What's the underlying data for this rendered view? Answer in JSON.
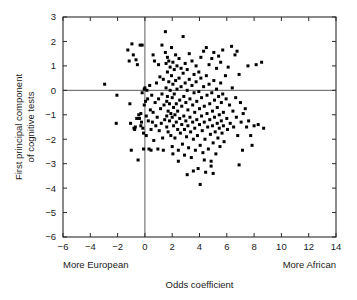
{
  "chart_data": {
    "type": "scatter",
    "title": "",
    "xlabel": "Odds coefficient",
    "ylabel": "First principal component\nof cognitive tests",
    "ylabel_line1": "First principal component",
    "ylabel_line2": "of cognitive tests",
    "xlim": [
      -6,
      14
    ],
    "ylim": [
      -6,
      3
    ],
    "xticks": [
      -6,
      -4,
      -2,
      0,
      2,
      4,
      6,
      8,
      10,
      12,
      14
    ],
    "yticks": [
      3,
      2,
      1,
      0,
      -1,
      -2,
      -3,
      -4,
      -5,
      -6
    ],
    "xticklabels": [
      "−6",
      "−4",
      "−2",
      "0",
      "2",
      "4",
      "6",
      "8",
      "10",
      "12",
      "14"
    ],
    "yticklabels": [
      "3",
      "2",
      "1",
      "0",
      "−1",
      "−2",
      "−3",
      "−4",
      "−5",
      "−6"
    ],
    "grid": false,
    "legend": false,
    "marker": "square",
    "marker_color": "#000000",
    "marker_size": 3,
    "reference_lines": [
      {
        "axis": "x",
        "value": 0
      },
      {
        "axis": "y",
        "value": 0
      }
    ],
    "annotations": [
      {
        "text": "More European",
        "position": "below-axis-left",
        "x": -6,
        "y": -6
      },
      {
        "text": "More African",
        "position": "below-axis-right",
        "x": 14,
        "y": -6
      }
    ],
    "n_points": 252,
    "points": [
      [
        -2.95,
        0.25
      ],
      [
        -2.05,
        -0.2
      ],
      [
        -2.1,
        -1.35
      ],
      [
        -1.25,
        1.65
      ],
      [
        -1.15,
        1.2
      ],
      [
        -1.1,
        -0.55
      ],
      [
        -1.05,
        -1.35
      ],
      [
        -1.0,
        -2.45
      ],
      [
        -0.95,
        1.9
      ],
      [
        -0.85,
        1.45
      ],
      [
        -0.8,
        -1.55
      ],
      [
        -0.75,
        -1.6
      ],
      [
        -0.7,
        -1.5
      ],
      [
        -0.65,
        1.25
      ],
      [
        -0.6,
        -1.15
      ],
      [
        -0.55,
        1.05
      ],
      [
        -0.5,
        -2.85
      ],
      [
        -0.45,
        -1.0
      ],
      [
        -0.4,
        -1.15
      ],
      [
        -0.35,
        1.85
      ],
      [
        -0.3,
        -0.95
      ],
      [
        -0.3,
        -1.45
      ],
      [
        -0.25,
        -1.3
      ],
      [
        -0.2,
        1.85
      ],
      [
        -0.2,
        -0.1
      ],
      [
        -0.15,
        -1.55
      ],
      [
        -0.1,
        -1.75
      ],
      [
        -0.1,
        -2.4
      ],
      [
        -0.05,
        0.05
      ],
      [
        -0.05,
        -0.6
      ],
      [
        0.0,
        0.1
      ],
      [
        0.05,
        -0.45
      ],
      [
        0.1,
        -1.05
      ],
      [
        0.1,
        -1.85
      ],
      [
        0.15,
        0.0
      ],
      [
        0.2,
        -0.35
      ],
      [
        0.25,
        -1.25
      ],
      [
        0.3,
        -2.4
      ],
      [
        0.35,
        0.2
      ],
      [
        0.4,
        -0.8
      ],
      [
        0.45,
        -1.6
      ],
      [
        0.5,
        -0.2
      ],
      [
        0.55,
        -1.3
      ],
      [
        0.6,
        1.45
      ],
      [
        0.6,
        -0.9
      ],
      [
        0.65,
        -2.05
      ],
      [
        0.7,
        1.2
      ],
      [
        0.75,
        -0.5
      ],
      [
        0.8,
        -1.45
      ],
      [
        0.85,
        0.3
      ],
      [
        0.9,
        -1.1
      ],
      [
        0.95,
        -2.4
      ],
      [
        1.0,
        1.05
      ],
      [
        1.0,
        -0.35
      ],
      [
        1.05,
        -1.65
      ],
      [
        1.1,
        0.55
      ],
      [
        1.15,
        -0.75
      ],
      [
        1.2,
        -1.35
      ],
      [
        1.25,
        1.85
      ],
      [
        1.25,
        -0.15
      ],
      [
        1.3,
        -1.95
      ],
      [
        1.35,
        0.45
      ],
      [
        1.4,
        -0.6
      ],
      [
        1.45,
        -1.2
      ],
      [
        1.5,
        2.4
      ],
      [
        1.5,
        1.55
      ],
      [
        1.55,
        1.1
      ],
      [
        1.55,
        0.1
      ],
      [
        1.6,
        -0.45
      ],
      [
        1.6,
        -1.05
      ],
      [
        1.6,
        -1.5
      ],
      [
        1.65,
        1.35
      ],
      [
        1.65,
        0.75
      ],
      [
        1.65,
        -0.25
      ],
      [
        1.7,
        -0.85
      ],
      [
        1.7,
        -1.7
      ],
      [
        1.75,
        1.2
      ],
      [
        1.75,
        0.35
      ],
      [
        1.8,
        -0.55
      ],
      [
        1.8,
        -1.25
      ],
      [
        1.85,
        0.95
      ],
      [
        1.85,
        0.0
      ],
      [
        1.9,
        -0.95
      ],
      [
        1.9,
        -1.85
      ],
      [
        1.95,
        1.75
      ],
      [
        1.95,
        0.6
      ],
      [
        2.0,
        -0.3
      ],
      [
        2.0,
        -1.1
      ],
      [
        2.0,
        -2.3
      ],
      [
        2.05,
        1.15
      ],
      [
        2.05,
        0.25
      ],
      [
        2.1,
        -0.7
      ],
      [
        2.1,
        -1.45
      ],
      [
        2.15,
        0.85
      ],
      [
        2.15,
        -0.15
      ],
      [
        2.2,
        -1.0
      ],
      [
        2.2,
        -1.95
      ],
      [
        2.25,
        1.45
      ],
      [
        2.25,
        0.4
      ],
      [
        2.3,
        -0.55
      ],
      [
        2.3,
        -1.3
      ],
      [
        2.35,
        1.0
      ],
      [
        2.35,
        0.05
      ],
      [
        2.4,
        -0.85
      ],
      [
        2.4,
        -1.6
      ],
      [
        2.45,
        -2.45
      ],
      [
        2.5,
        1.3
      ],
      [
        2.5,
        0.5
      ],
      [
        2.55,
        -0.4
      ],
      [
        2.55,
        -1.15
      ],
      [
        2.6,
        -1.75
      ],
      [
        2.65,
        0.9
      ],
      [
        2.65,
        0.15
      ],
      [
        2.7,
        -0.65
      ],
      [
        2.7,
        -1.4
      ],
      [
        2.75,
        -2.2
      ],
      [
        2.8,
        2.2
      ],
      [
        2.8,
        0.7
      ],
      [
        2.85,
        -0.25
      ],
      [
        2.85,
        -1.05
      ],
      [
        2.9,
        -1.6
      ],
      [
        2.9,
        -2.65
      ],
      [
        2.95,
        1.1
      ],
      [
        2.95,
        0.3
      ],
      [
        3.0,
        -0.5
      ],
      [
        3.0,
        -1.25
      ],
      [
        3.05,
        -1.9
      ],
      [
        3.1,
        0.85
      ],
      [
        3.1,
        0.0
      ],
      [
        3.15,
        -0.8
      ],
      [
        3.15,
        -1.45
      ],
      [
        3.2,
        -2.35
      ],
      [
        3.25,
        1.5
      ],
      [
        3.25,
        0.45
      ],
      [
        3.3,
        -0.35
      ],
      [
        3.3,
        -1.1
      ],
      [
        3.35,
        -1.7
      ],
      [
        3.4,
        -2.75
      ],
      [
        3.45,
        1.2
      ],
      [
        3.45,
        0.2
      ],
      [
        3.5,
        -0.6
      ],
      [
        3.5,
        -1.3
      ],
      [
        3.55,
        -2.0
      ],
      [
        3.6,
        0.65
      ],
      [
        3.6,
        -0.1
      ],
      [
        3.65,
        -0.9
      ],
      [
        3.65,
        -1.55
      ],
      [
        3.7,
        -2.45
      ],
      [
        3.75,
        1.0
      ],
      [
        3.75,
        0.35
      ],
      [
        3.8,
        -0.45
      ],
      [
        3.8,
        -1.2
      ],
      [
        3.85,
        -1.85
      ],
      [
        3.9,
        -3.2
      ],
      [
        3.95,
        0.75
      ],
      [
        3.95,
        -0.05
      ],
      [
        4.0,
        -0.75
      ],
      [
        4.0,
        -1.4
      ],
      [
        4.05,
        -2.25
      ],
      [
        4.05,
        -3.85
      ],
      [
        4.1,
        1.35
      ],
      [
        4.1,
        0.5
      ],
      [
        4.15,
        -0.3
      ],
      [
        4.15,
        -1.05
      ],
      [
        4.2,
        -1.65
      ],
      [
        4.25,
        -2.55
      ],
      [
        4.3,
        1.6
      ],
      [
        4.3,
        0.15
      ],
      [
        4.35,
        -0.65
      ],
      [
        4.35,
        -1.3
      ],
      [
        4.4,
        -2.0
      ],
      [
        4.45,
        -3.35
      ],
      [
        4.5,
        1.75
      ],
      [
        4.5,
        0.6
      ],
      [
        4.55,
        -0.2
      ],
      [
        4.55,
        -0.95
      ],
      [
        4.6,
        -1.5
      ],
      [
        4.65,
        -2.4
      ],
      [
        4.7,
        1.05
      ],
      [
        4.7,
        0.25
      ],
      [
        4.75,
        -0.55
      ],
      [
        4.75,
        -1.2
      ],
      [
        4.8,
        -1.8
      ],
      [
        4.85,
        -2.9
      ],
      [
        4.9,
        1.3
      ],
      [
        4.9,
        -0.1
      ],
      [
        4.95,
        -0.85
      ],
      [
        4.95,
        -1.45
      ],
      [
        5.0,
        -2.15
      ],
      [
        5.05,
        1.55
      ],
      [
        5.05,
        0.4
      ],
      [
        5.1,
        -0.4
      ],
      [
        5.1,
        -1.1
      ],
      [
        5.15,
        -1.7
      ],
      [
        5.2,
        -2.6
      ],
      [
        5.25,
        0.9
      ],
      [
        5.25,
        0.05
      ],
      [
        5.3,
        -0.7
      ],
      [
        5.3,
        -1.35
      ],
      [
        5.35,
        -1.95
      ],
      [
        5.4,
        1.4
      ],
      [
        5.4,
        -0.25
      ],
      [
        5.45,
        -1.0
      ],
      [
        5.45,
        -1.55
      ],
      [
        5.5,
        -2.3
      ],
      [
        5.55,
        1.15
      ],
      [
        5.55,
        0.3
      ],
      [
        5.6,
        -0.5
      ],
      [
        5.6,
        -1.25
      ],
      [
        5.65,
        -1.75
      ],
      [
        5.7,
        1.65
      ],
      [
        5.7,
        -0.15
      ],
      [
        5.75,
        -0.9
      ],
      [
        5.75,
        -1.45
      ],
      [
        5.8,
        -2.1
      ],
      [
        5.9,
        0.6
      ],
      [
        5.95,
        -0.35
      ],
      [
        6.0,
        -1.15
      ],
      [
        6.05,
        -1.6
      ],
      [
        6.1,
        0.95
      ],
      [
        6.2,
        -0.6
      ],
      [
        6.25,
        -1.35
      ],
      [
        6.35,
        1.8
      ],
      [
        6.4,
        0.1
      ],
      [
        6.45,
        -0.85
      ],
      [
        6.5,
        -1.5
      ],
      [
        6.6,
        1.45
      ],
      [
        6.65,
        -0.3
      ],
      [
        6.7,
        -1.1
      ],
      [
        6.75,
        1.6
      ],
      [
        6.8,
        -1.85
      ],
      [
        6.9,
        0.65
      ],
      [
        7.0,
        -0.5
      ],
      [
        7.05,
        -1.3
      ],
      [
        7.15,
        -2.45
      ],
      [
        7.2,
        -0.95
      ],
      [
        7.35,
        -0.75
      ],
      [
        7.45,
        -1.5
      ],
      [
        7.55,
        1.0
      ],
      [
        7.6,
        -1.25
      ],
      [
        7.75,
        -1.85
      ],
      [
        7.85,
        -2.25
      ],
      [
        8.0,
        -1.45
      ],
      [
        8.15,
        1.05
      ],
      [
        8.3,
        -1.4
      ],
      [
        8.55,
        1.15
      ],
      [
        8.7,
        -1.55
      ],
      [
        6.9,
        -3.05
      ],
      [
        4.85,
        -3.1
      ],
      [
        3.55,
        -3.3
      ],
      [
        3.1,
        -3.45
      ],
      [
        2.45,
        -2.9
      ],
      [
        2.05,
        -2.6
      ],
      [
        1.35,
        -2.45
      ],
      [
        0.45,
        -2.45
      ],
      [
        5.0,
        -3.4
      ],
      [
        4.35,
        -2.85
      ]
    ]
  }
}
